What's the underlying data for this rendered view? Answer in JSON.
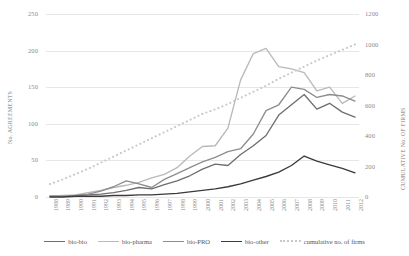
{
  "chart_data": {
    "type": "line",
    "title": "",
    "xlabel": "",
    "ylabel": "No. AGREEMENTS",
    "y2label": "CUMULATIVE No. OF FIRMS",
    "grid": true,
    "legend_position": "bottom",
    "ylim": [
      0,
      250
    ],
    "y2lim": [
      0,
      1200
    ],
    "yticks": [
      0,
      50,
      100,
      150,
      200,
      250
    ],
    "y2ticks": [
      0,
      200,
      400,
      600,
      800,
      1000,
      1200
    ],
    "categories": [
      "1988",
      "1989",
      "1990",
      "1991",
      "1992",
      "1993",
      "1994",
      "1995",
      "1996",
      "1997",
      "1998",
      "1999",
      "2000",
      "2001",
      "2002",
      "2003",
      "2004",
      "2005",
      "2006",
      "2007",
      "2008",
      "2009",
      "2010",
      "2011",
      "2012"
    ],
    "series": [
      {
        "name": "bio-bio",
        "axis": "left",
        "color": "#6e6e6e",
        "style": "solid",
        "values": [
          1,
          1,
          2,
          3,
          4,
          6,
          9,
          13,
          11,
          17,
          22,
          29,
          38,
          45,
          43,
          58,
          70,
          84,
          112,
          126,
          140,
          120,
          128,
          116,
          109
        ]
      },
      {
        "name": "bio-pharma",
        "axis": "left",
        "color": "#b9b9b9",
        "style": "solid",
        "values": [
          1,
          2,
          3,
          6,
          9,
          13,
          16,
          20,
          26,
          31,
          40,
          56,
          69,
          70,
          94,
          160,
          196,
          203,
          178,
          175,
          170,
          145,
          150,
          128,
          138
        ]
      },
      {
        "name": "bio-PRO",
        "axis": "left",
        "color": "#8d8d8d",
        "style": "solid",
        "values": [
          1,
          1,
          2,
          4,
          8,
          14,
          22,
          18,
          13,
          24,
          32,
          40,
          48,
          54,
          62,
          66,
          86,
          118,
          126,
          150,
          147,
          136,
          140,
          138,
          131
        ]
      },
      {
        "name": "bio-other",
        "axis": "left",
        "color": "#3a3a3a",
        "style": "solid",
        "values": [
          0,
          0,
          1,
          1,
          1,
          2,
          2,
          3,
          3,
          4,
          5,
          7,
          9,
          11,
          14,
          18,
          23,
          28,
          34,
          43,
          56,
          49,
          44,
          39,
          33
        ]
      },
      {
        "name": "cumulative no. of firms",
        "axis": "right",
        "color": "#c8c8c8",
        "style": "dotted",
        "values": [
          85,
          115,
          150,
          185,
          225,
          265,
          305,
          345,
          385,
          425,
          465,
          505,
          545,
          575,
          610,
          650,
          690,
          730,
          775,
          815,
          855,
          895,
          930,
          965,
          1000
        ]
      }
    ]
  },
  "legend": {
    "items": [
      {
        "label": "bio-bio"
      },
      {
        "label": "bio-pharma"
      },
      {
        "label": "bio-PRO"
      },
      {
        "label": "bio-other"
      },
      {
        "label": "cumulative no. of firms"
      }
    ]
  }
}
